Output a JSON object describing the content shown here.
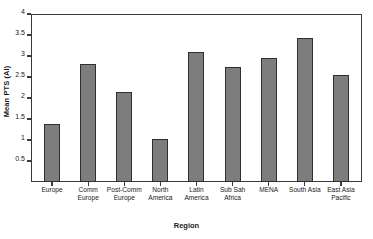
{
  "chart_data": {
    "type": "bar",
    "title": "",
    "xlabel": "Region",
    "ylabel": "Mean PTS (AI)",
    "categories": [
      "Europe",
      "Comm Europe",
      "Post-Comm Europe",
      "North America",
      "Latin America",
      "Sub Sah Africa",
      "MENA",
      "South Asia",
      "East Asia Pacific"
    ],
    "category_lines": [
      "Europe",
      "Comm\nEurope",
      "Post-Comm\nEurope",
      "North\nAmerica",
      "Latin\nAmerica",
      "Sub Sah\nAfrica",
      "MENA",
      "South Asia",
      "East Asia\nPacific"
    ],
    "values": [
      1.37,
      2.82,
      2.14,
      1.03,
      3.1,
      2.73,
      2.96,
      3.43,
      2.55
    ],
    "ylim": [
      0,
      4
    ],
    "ytick_values": [
      0.5,
      1,
      1.5,
      2,
      2.5,
      3,
      3.5,
      4
    ],
    "ytick_labels": [
      "0.5",
      "1",
      "1.5",
      "2",
      "2.5",
      "3",
      "3.5",
      "4"
    ],
    "grid": false,
    "legend": false,
    "bar_color": "#7d7d7d",
    "bar_border_color": "#2f2f2f",
    "axis_color": "#3a3a3a",
    "background": "#ffffff"
  }
}
